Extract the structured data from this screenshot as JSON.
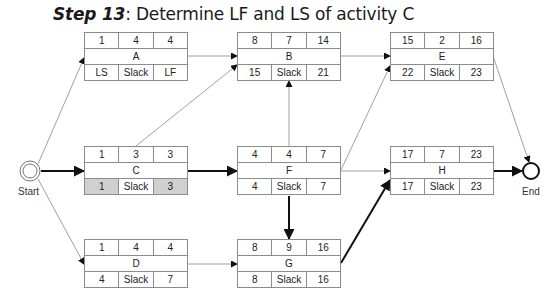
{
  "title": {
    "step": "Step 13",
    "text": ": Determine LF and LS of activity C"
  },
  "colors": {
    "highlight": "#d0d0d0",
    "border": "#8c8c8c",
    "critical_edge": "#111111",
    "normal_edge": "#888888"
  },
  "terminals": {
    "start": "Start",
    "end": "End"
  },
  "nodes": {
    "A": {
      "name": "A",
      "es": "1",
      "dur": "4",
      "ef": "4",
      "ls": "LS",
      "slack": "Slack",
      "lf": "LF"
    },
    "B": {
      "name": "B",
      "es": "8",
      "dur": "7",
      "ef": "14",
      "ls": "15",
      "slack": "Slack",
      "lf": "21"
    },
    "C": {
      "name": "C",
      "es": "1",
      "dur": "3",
      "ef": "3",
      "ls": "1",
      "slack": "Slack",
      "lf": "3"
    },
    "D": {
      "name": "D",
      "es": "1",
      "dur": "4",
      "ef": "4",
      "ls": "4",
      "slack": "Slack",
      "lf": "7"
    },
    "E": {
      "name": "E",
      "es": "15",
      "dur": "2",
      "ef": "16",
      "ls": "22",
      "slack": "Slack",
      "lf": "23"
    },
    "F": {
      "name": "F",
      "es": "4",
      "dur": "4",
      "ef": "7",
      "ls": "4",
      "slack": "Slack",
      "lf": "7"
    },
    "G": {
      "name": "G",
      "es": "8",
      "dur": "9",
      "ef": "16",
      "ls": "8",
      "slack": "Slack",
      "lf": "16"
    },
    "H": {
      "name": "H",
      "es": "17",
      "dur": "7",
      "ef": "23",
      "ls": "17",
      "slack": "Slack",
      "lf": "23"
    }
  },
  "edges": [
    {
      "from": "Start",
      "to": "A",
      "critical": false
    },
    {
      "from": "Start",
      "to": "C",
      "critical": true
    },
    {
      "from": "Start",
      "to": "D",
      "critical": false
    },
    {
      "from": "A",
      "to": "B",
      "critical": false
    },
    {
      "from": "C",
      "to": "B",
      "critical": false
    },
    {
      "from": "C",
      "to": "F",
      "critical": true
    },
    {
      "from": "D",
      "to": "G",
      "critical": false
    },
    {
      "from": "F",
      "to": "B",
      "critical": false
    },
    {
      "from": "F",
      "to": "E",
      "critical": false
    },
    {
      "from": "F",
      "to": "H",
      "critical": false
    },
    {
      "from": "F",
      "to": "G",
      "critical": true
    },
    {
      "from": "B",
      "to": "E",
      "critical": false
    },
    {
      "from": "G",
      "to": "H",
      "critical": true
    },
    {
      "from": "E",
      "to": "End",
      "critical": false
    },
    {
      "from": "H",
      "to": "End",
      "critical": true
    }
  ]
}
